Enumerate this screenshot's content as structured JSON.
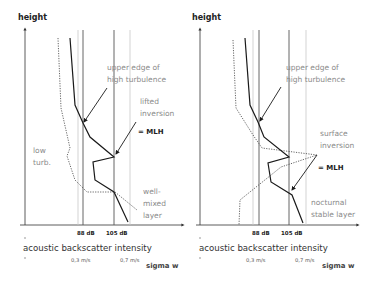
{
  "colors": {
    "axis": "#333333",
    "profile_solid": "#1a1a1a",
    "profile_dotted": "#555555",
    "threshold_dark": "#555555",
    "threshold_light": "#c8c8c8",
    "annotation_text": "#8a8a8a"
  },
  "panels": [
    {
      "id": "left",
      "y_axis_label": "height",
      "annotations": {
        "upper_edge_1": "upper edge of",
        "upper_edge_2": "high turbulence",
        "inversion_1": "lifted",
        "inversion_2": "inversion",
        "mlh": "= MLH",
        "low_turb_1": "low",
        "low_turb_2": "turb.",
        "layer_1": "well-",
        "layer_2": "mixed",
        "layer_3": "layer"
      },
      "ticks": {
        "db_low": "88 dB",
        "db_high": "105 dB",
        "ms_low": "0,3 m/s",
        "ms_high": "0,7 m/s"
      },
      "x_axis_label": "acoustic backscatter intensity",
      "secondary_axis_label": "sigma w"
    },
    {
      "id": "right",
      "y_axis_label": "height",
      "annotations": {
        "upper_edge_1": "upper edge of",
        "upper_edge_2": "high turbulence",
        "inversion_1": "surface",
        "inversion_2": "inversion",
        "mlh": "= MLH",
        "layer_1": "nocturnal",
        "layer_2": "stable layer"
      },
      "ticks": {
        "db_low": "88 dB",
        "db_high": "105 dB",
        "ms_low": "0,3 m/s",
        "ms_high": "0,7 m/s"
      },
      "x_axis_label": "acoustic backscatter intensity",
      "secondary_axis_label": "sigma w"
    }
  ]
}
